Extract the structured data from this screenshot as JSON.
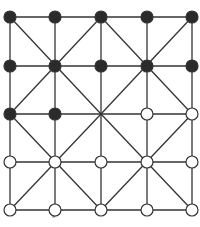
{
  "game": {
    "name": "Alquerque board",
    "grid_size": 5,
    "columns_x": [
      10,
      55,
      101,
      147,
      192
    ],
    "rows_y": [
      17,
      66,
      114,
      162,
      210
    ],
    "node_radius": 6,
    "colors": {
      "line": "#333333",
      "black_piece": "#2b2b2b",
      "white_piece": "#ffffff",
      "piece_outline": "#333333"
    },
    "board": [
      [
        "B",
        "B",
        "B",
        "B",
        "B"
      ],
      [
        "B",
        "B",
        "B",
        "B",
        "B"
      ],
      [
        "B",
        "B",
        "",
        "W",
        "W"
      ],
      [
        "W",
        "W",
        "W",
        "W",
        "W"
      ],
      [
        "W",
        "W",
        "W",
        "W",
        "W"
      ]
    ],
    "diagonal_centers": [
      [
        1,
        1
      ],
      [
        1,
        3
      ],
      [
        3,
        1
      ],
      [
        3,
        3
      ]
    ]
  },
  "caption": "″"
}
